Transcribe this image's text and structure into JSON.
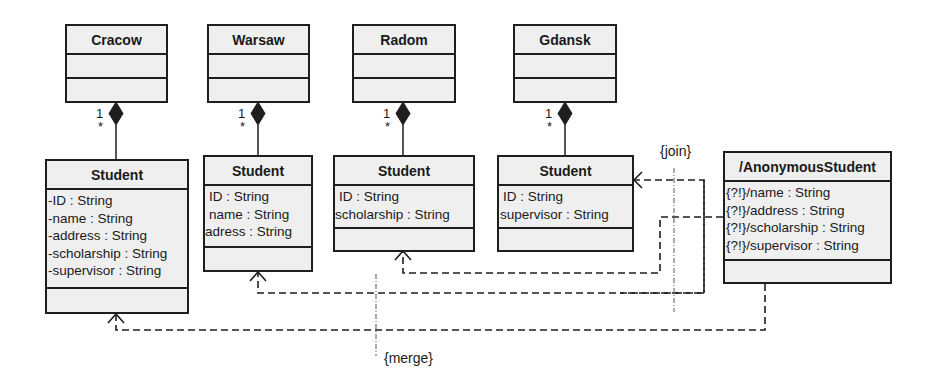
{
  "diagram": {
    "type": "UML class diagram",
    "containers": [
      {
        "name": "Cracow",
        "attributes": [],
        "operations": []
      },
      {
        "name": "Warsaw",
        "attributes": [],
        "operations": []
      },
      {
        "name": "Radom",
        "attributes": [],
        "operations": []
      },
      {
        "name": "Gdansk",
        "attributes": [],
        "operations": []
      }
    ],
    "students": [
      {
        "owner": "Cracow",
        "name": "Student",
        "attributes": [
          "-ID : String",
          "-name : String",
          "-address : String",
          "-scholarship : String",
          "-supervisor : String"
        ]
      },
      {
        "owner": "Warsaw",
        "name": "Student",
        "attributes": [
          "ID : String",
          "name : String",
          "adress : String"
        ]
      },
      {
        "owner": "Radom",
        "name": "Student",
        "attributes": [
          "ID : String",
          "scholarship : String"
        ]
      },
      {
        "owner": "Gdansk",
        "name": "Student",
        "attributes": [
          "ID : String",
          "supervisor : String"
        ]
      }
    ],
    "derived": {
      "name": "/AnonymousStudent",
      "attributes": [
        "{?!}/name : String",
        "{?!}/address : String",
        "{?!}/scholarship : String",
        "{?!}/supervisor : String"
      ]
    },
    "multiplicity": {
      "owner_end": "1",
      "part_end": "*"
    },
    "constraints": {
      "join": "{join}",
      "merge": "{merge}"
    },
    "colors": {
      "line": "#1e1e1e",
      "box_fill": "#efefef",
      "background": "#ffffff"
    }
  }
}
